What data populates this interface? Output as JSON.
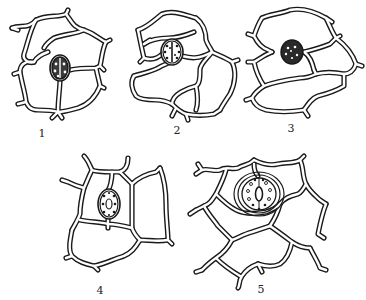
{
  "figure": {
    "type": "stomata-types-diagram",
    "panels": [
      {
        "id": 1,
        "label": "1",
        "description": "stoma surrounded by irregular epidermal cells"
      },
      {
        "id": 2,
        "label": "2",
        "description": "stoma flanked by unequal subsidiary cells"
      },
      {
        "id": 3,
        "label": "3",
        "description": "stoma between two parallel subsidiary cells"
      },
      {
        "id": 4,
        "label": "4",
        "description": "stoma with subsidiary cells parallel to pore"
      },
      {
        "id": 5,
        "label": "5",
        "description": "stoma encircled by ring of subsidiary cells"
      }
    ]
  },
  "colors": {
    "line": "#1a1a1a",
    "background": "#ffffff"
  }
}
